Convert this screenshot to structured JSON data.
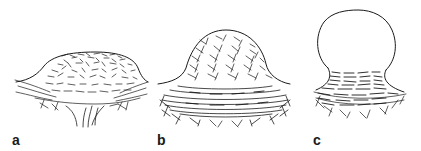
{
  "figure": {
    "panels": [
      {
        "id": "a",
        "label": "a",
        "shape": "low-flat-mound-with-stalk"
      },
      {
        "id": "b",
        "label": "b",
        "shape": "raised-dome-on-concentric-base"
      },
      {
        "id": "c",
        "label": "c",
        "shape": "smooth-sphere-on-narrow-neck"
      }
    ],
    "colors": {
      "ink": "#1a1a1a",
      "background": "#ffffff"
    }
  }
}
